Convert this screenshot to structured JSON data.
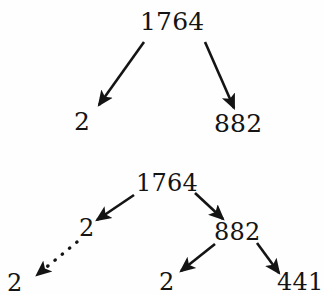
{
  "figure": {
    "background_color": "#fefefe",
    "ink_color": "#141414",
    "width": 324,
    "height": 295
  },
  "diagrams": [
    {
      "id": "tree-top",
      "description": "First factorization step of 1764",
      "nodes": [
        {
          "id": "t1-root",
          "label": "1764",
          "x": 140,
          "y": 9,
          "font_size": 25
        },
        {
          "id": "t1-left",
          "label": "2",
          "x": 74,
          "y": 109,
          "font_size": 25
        },
        {
          "id": "t1-right",
          "label": "882",
          "x": 214,
          "y": 111,
          "font_size": 25
        }
      ],
      "edges": [
        {
          "id": "t1-edge-left",
          "from": "t1-root",
          "to": "t1-left",
          "style": "solid",
          "x1": 144,
          "y1": 42,
          "x2": 99,
          "y2": 105
        },
        {
          "id": "t1-edge-right",
          "from": "t1-root",
          "to": "t1-right",
          "style": "solid",
          "x1": 205,
          "y1": 42,
          "x2": 234,
          "y2": 108
        }
      ]
    },
    {
      "id": "tree-bottom",
      "description": "Continued factorization of 1764 into 2, 2, 882, 441",
      "nodes": [
        {
          "id": "t2-root",
          "label": "1764",
          "x": 136,
          "y": 171,
          "font_size": 24
        },
        {
          "id": "t2-left",
          "label": "2",
          "x": 79,
          "y": 216,
          "font_size": 24
        },
        {
          "id": "t2-leftleft",
          "label": "2",
          "x": 7,
          "y": 271,
          "font_size": 24
        },
        {
          "id": "t2-right",
          "label": "882",
          "x": 214,
          "y": 220,
          "font_size": 24
        },
        {
          "id": "t2-rightleft",
          "label": "2",
          "x": 159,
          "y": 270,
          "font_size": 24
        },
        {
          "id": "t2-rightright",
          "label": "441",
          "x": 277,
          "y": 270,
          "font_size": 24
        }
      ],
      "edges": [
        {
          "id": "t2-edge-root-left",
          "from": "t2-root",
          "to": "t2-left",
          "style": "solid",
          "x1": 134,
          "y1": 195,
          "x2": 97,
          "y2": 220
        },
        {
          "id": "t2-edge-left-leftleft",
          "from": "t2-left",
          "to": "t2-leftleft",
          "style": "dotted",
          "x1": 77,
          "y1": 242,
          "x2": 37,
          "y2": 275
        },
        {
          "id": "t2-edge-root-right",
          "from": "t2-root",
          "to": "t2-right",
          "style": "solid",
          "x1": 195,
          "y1": 193,
          "x2": 223,
          "y2": 219
        },
        {
          "id": "t2-edge-right-rightleft",
          "from": "t2-right",
          "to": "t2-rightleft",
          "style": "solid",
          "x1": 215,
          "y1": 244,
          "x2": 181,
          "y2": 271
        },
        {
          "id": "t2-edge-right-rightright",
          "from": "t2-right",
          "to": "t2-rightright",
          "style": "solid",
          "x1": 257,
          "y1": 243,
          "x2": 279,
          "y2": 273
        }
      ]
    }
  ]
}
